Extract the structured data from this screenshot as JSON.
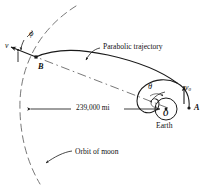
{
  "figure": {
    "background_color": "#ffffff",
    "ink_color": "#1a1a1a",
    "width": 207,
    "height": 187
  },
  "labels": {
    "parabolic_trajectory": "Parabolic trajectory",
    "orbit_of_moon": "Orbit of moon",
    "distance": "239,000 mi",
    "earth": "Earth",
    "point_b": "B",
    "point_a": "A",
    "center_o": "O",
    "angle_phi": "ϕ",
    "angle_theta": "θ",
    "velocity_v": "v",
    "velocity_v0_base": "v",
    "velocity_v0_sub": "0"
  },
  "geometry": {
    "earth_center": {
      "x": 166,
      "y": 109
    },
    "earth_radius": 11,
    "point_a": {
      "x": 189,
      "y": 108
    },
    "point_b": {
      "x": 36,
      "y": 57
    },
    "moon_orbit_radius": 152,
    "dimension_line_y": 109,
    "dimension_left_x": 31,
    "dimension_right_x": 160
  },
  "colors": {
    "ink": "#1a1a1a",
    "dashed": "#666666",
    "paper": "#ffffff"
  }
}
